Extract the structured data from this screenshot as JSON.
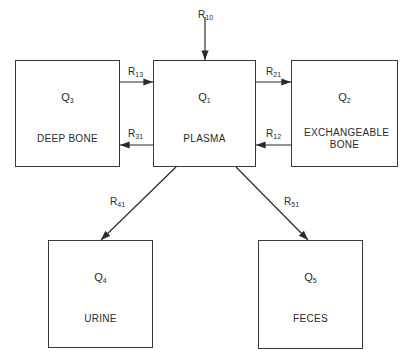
{
  "diagram": {
    "type": "compartment-model",
    "compartments": [
      {
        "id": "Q1",
        "symbol": "Q",
        "subscript": "1",
        "name": "PLASMA"
      },
      {
        "id": "Q2",
        "symbol": "Q",
        "subscript": "2",
        "name": "EXCHANGEABLE BONE"
      },
      {
        "id": "Q3",
        "symbol": "Q",
        "subscript": "3",
        "name": "DEEP BONE"
      },
      {
        "id": "Q4",
        "symbol": "Q",
        "subscript": "4",
        "name": "URINE"
      },
      {
        "id": "Q5",
        "symbol": "Q",
        "subscript": "5",
        "name": "FECES"
      }
    ],
    "flows": [
      {
        "label": "R",
        "subscript": "10",
        "from": "external",
        "to": "Q1"
      },
      {
        "label": "R",
        "subscript": "13",
        "from": "Q3",
        "to": "Q1"
      },
      {
        "label": "R",
        "subscript": "31",
        "from": "Q1",
        "to": "Q3"
      },
      {
        "label": "R",
        "subscript": "21",
        "from": "Q1",
        "to": "Q2"
      },
      {
        "label": "R",
        "subscript": "12",
        "from": "Q2",
        "to": "Q1"
      },
      {
        "label": "R",
        "subscript": "41",
        "from": "Q1",
        "to": "Q4"
      },
      {
        "label": "R",
        "subscript": "51",
        "from": "Q1",
        "to": "Q5"
      }
    ]
  }
}
